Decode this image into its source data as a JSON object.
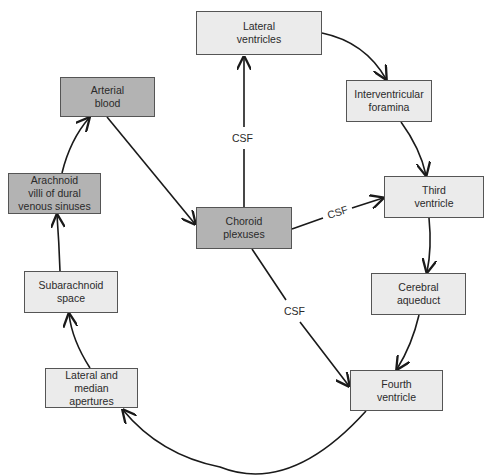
{
  "diagram": {
    "nodes": [
      {
        "id": "lateral_ventricles",
        "label": "Lateral\nventricles",
        "shade": "light",
        "x": 196,
        "y": 11,
        "w": 126,
        "h": 44
      },
      {
        "id": "interventricular_foramina",
        "label": "Interventricular\nforamina",
        "shade": "light",
        "x": 346,
        "y": 80,
        "w": 86,
        "h": 42
      },
      {
        "id": "third_ventricle",
        "label": "Third\nventricle",
        "shade": "light",
        "x": 384,
        "y": 176,
        "w": 100,
        "h": 42
      },
      {
        "id": "cerebral_aqueduct",
        "label": "Cerebral\naqueduct",
        "shade": "light",
        "x": 371,
        "y": 273,
        "w": 95,
        "h": 42
      },
      {
        "id": "fourth_ventricle",
        "label": "Fourth\nventricle",
        "shade": "light",
        "x": 350,
        "y": 370,
        "w": 93,
        "h": 41
      },
      {
        "id": "lateral_median_apertures",
        "label": "Lateral and median\napertures",
        "shade": "light",
        "x": 45,
        "y": 368,
        "w": 93,
        "h": 40
      },
      {
        "id": "subarachnoid_space",
        "label": "Subarachnoid\nspace",
        "shade": "light",
        "x": 24,
        "y": 271,
        "w": 94,
        "h": 42
      },
      {
        "id": "arachnoid_villi",
        "label": "Arachnoid\nvilli of dural\nvenous sinuses",
        "shade": "dark",
        "x": 8,
        "y": 173,
        "w": 93,
        "h": 41
      },
      {
        "id": "arterial_blood",
        "label": "Arterial\nblood",
        "shade": "dark",
        "x": 60,
        "y": 77,
        "w": 95,
        "h": 40
      },
      {
        "id": "choroid_plexuses",
        "label": "Choroid\nplexuses",
        "shade": "dark",
        "x": 196,
        "y": 207,
        "w": 96,
        "h": 42
      }
    ],
    "edges": [
      {
        "from": "choroid_plexuses",
        "to": "lateral_ventricles",
        "label": "CSF"
      },
      {
        "from": "choroid_plexuses",
        "to": "third_ventricle",
        "label": "CSF"
      },
      {
        "from": "choroid_plexuses",
        "to": "fourth_ventricle",
        "label": "CSF"
      },
      {
        "from": "lateral_ventricles",
        "to": "interventricular_foramina",
        "label": ""
      },
      {
        "from": "interventricular_foramina",
        "to": "third_ventricle",
        "label": ""
      },
      {
        "from": "third_ventricle",
        "to": "cerebral_aqueduct",
        "label": ""
      },
      {
        "from": "cerebral_aqueduct",
        "to": "fourth_ventricle",
        "label": ""
      },
      {
        "from": "fourth_ventricle",
        "to": "lateral_median_apertures",
        "label": ""
      },
      {
        "from": "lateral_median_apertures",
        "to": "subarachnoid_space",
        "label": ""
      },
      {
        "from": "subarachnoid_space",
        "to": "arachnoid_villi",
        "label": ""
      },
      {
        "from": "arachnoid_villi",
        "to": "arterial_blood",
        "label": ""
      },
      {
        "from": "arterial_blood",
        "to": "choroid_plexuses",
        "label": ""
      }
    ],
    "edge_labels": {
      "csf_up": "CSF",
      "csf_right": "CSF",
      "csf_down": "CSF"
    },
    "colors": {
      "dark_box": "#b3b3b3",
      "light_box": "#ebebeb",
      "line": "#1a1a1a"
    }
  }
}
